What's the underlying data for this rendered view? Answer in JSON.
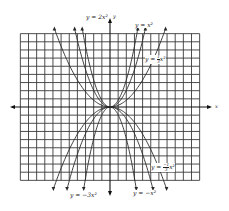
{
  "figure": {
    "type": "parabola-family-graph",
    "axes": {
      "x_label": "x",
      "y_label": "y"
    },
    "grid": {
      "origin_px": [
        110,
        107
      ],
      "spacing_px": 8.15,
      "x_lines_left": 11,
      "x_lines_right": 11,
      "y_lines_up": 9,
      "y_lines_down": 9
    },
    "labels": {
      "c1": "y = 2x²",
      "c2": "y = x²",
      "c3_prefix": "y = ",
      "c3_num": "1",
      "c3_den": "3",
      "c3_suffix": "x²",
      "c4_prefix": "y = ",
      "c4_num": "−1",
      "c4_den": "3",
      "c4_suffix": "x²",
      "c5": "y = −3x²",
      "c6": "y = −x²"
    },
    "curves": [
      {
        "name": "y = 2x^2",
        "a": 2
      },
      {
        "name": "y = x^2",
        "a": 1
      },
      {
        "name": "y = (1/3)x^2",
        "a": 0.3333
      },
      {
        "name": "y = -(1/3)x^2",
        "a": -0.3333
      },
      {
        "name": "y = -x^2",
        "a": -1
      },
      {
        "name": "y = -3x^2",
        "a": -3
      }
    ],
    "colors": {
      "grid": "#3a3a3a",
      "curve": "#2a2a2a",
      "background": "#ffffff"
    }
  }
}
